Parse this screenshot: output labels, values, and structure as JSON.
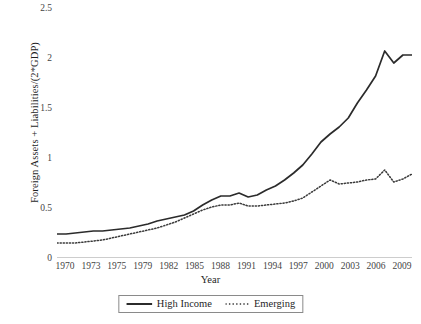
{
  "chart_data": {
    "type": "line",
    "title": "",
    "xlabel": "Year",
    "ylabel": "Foreign Assets + Liabilities/(2*GDP)",
    "xlim": [
      1970,
      2010
    ],
    "ylim": [
      0,
      2.5
    ],
    "yticks": [
      "0",
      "0.5",
      "1",
      "1.5",
      "2",
      "2.5"
    ],
    "ytick_values": [
      0,
      0.5,
      1,
      1.5,
      2,
      2.5
    ],
    "xticks": [
      "1970",
      "1973",
      "1975",
      "1979",
      "1982",
      "1985",
      "1988",
      "1991",
      "1994",
      "1997",
      "2000",
      "2003",
      "2006",
      "2009"
    ],
    "xtick_values": [
      1970,
      1973,
      1975,
      1979,
      1982,
      1985,
      1988,
      1991,
      1994,
      1997,
      2000,
      2003,
      2006,
      2009
    ],
    "grid": false,
    "legend_position": "bottom",
    "x": [
      1970,
      1971,
      1972,
      1973,
      1974,
      1975,
      1976,
      1977,
      1978,
      1979,
      1980,
      1981,
      1982,
      1983,
      1984,
      1985,
      1986,
      1987,
      1988,
      1989,
      1990,
      1991,
      1992,
      1993,
      1994,
      1995,
      1996,
      1997,
      1998,
      1999,
      2000,
      2001,
      2002,
      2003,
      2004,
      2005,
      2006,
      2007,
      2008,
      2009
    ],
    "series": [
      {
        "name": "High Income",
        "style": "solid",
        "color": "#2b2b2b",
        "values": [
          0.24,
          0.24,
          0.25,
          0.26,
          0.27,
          0.27,
          0.28,
          0.29,
          0.3,
          0.32,
          0.34,
          0.37,
          0.39,
          0.41,
          0.43,
          0.47,
          0.53,
          0.58,
          0.62,
          0.62,
          0.65,
          0.61,
          0.63,
          0.68,
          0.72,
          0.78,
          0.85,
          0.93,
          1.04,
          1.16,
          1.24,
          1.31,
          1.4,
          1.55,
          1.68,
          1.82,
          2.07,
          1.95,
          2.03,
          2.03
        ]
      },
      {
        "name": "Emerging",
        "style": "dotted",
        "color": "#3a3a3a",
        "values": [
          0.15,
          0.15,
          0.15,
          0.16,
          0.17,
          0.18,
          0.2,
          0.22,
          0.24,
          0.26,
          0.28,
          0.3,
          0.33,
          0.36,
          0.4,
          0.44,
          0.48,
          0.51,
          0.53,
          0.53,
          0.55,
          0.52,
          0.52,
          0.53,
          0.54,
          0.55,
          0.57,
          0.6,
          0.66,
          0.72,
          0.78,
          0.74,
          0.75,
          0.76,
          0.78,
          0.79,
          0.88,
          0.76,
          0.79,
          0.84
        ]
      }
    ]
  },
  "legend": {
    "items": [
      {
        "label": "High Income"
      },
      {
        "label": "Emerging"
      }
    ]
  },
  "axes": {
    "y_title": "Foreign Assets + Liabilities/(2*GDP)",
    "x_title": "Year"
  }
}
